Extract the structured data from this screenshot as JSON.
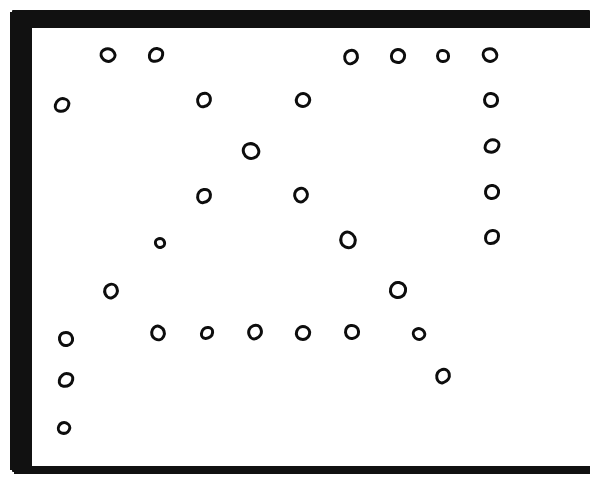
{
  "figure": {
    "background_color": "#ffffff",
    "ink_color": "#0d0d0d",
    "frame": {
      "label": "thick hand-inked rectangular border",
      "outer": {
        "x": 12,
        "y": 10,
        "width": 578,
        "height": 462
      },
      "inner": {
        "x": 20,
        "y": 18,
        "width": 558,
        "height": 438
      },
      "thickness_px": 8,
      "color": "#111111"
    },
    "ghost_text": "",
    "marker_count": 32
  },
  "chart_data": {
    "type": "scatter",
    "xlabel": "",
    "ylabel": "",
    "xlim": [
      0,
      597
    ],
    "ylim": [
      480,
      0
    ],
    "grid": false,
    "legend": "none",
    "marker_style": "open-circle",
    "marker_color": "#0d0d0d",
    "points": [
      {
        "id": "c01",
        "x": 108,
        "y": 55,
        "r": 8,
        "sw": 3
      },
      {
        "id": "c02",
        "x": 156,
        "y": 55,
        "r": 8,
        "sw": 3
      },
      {
        "id": "c03",
        "x": 351,
        "y": 57,
        "r": 8,
        "sw": 3
      },
      {
        "id": "c04",
        "x": 398,
        "y": 56,
        "r": 8,
        "sw": 3
      },
      {
        "id": "c05",
        "x": 443,
        "y": 56,
        "r": 7,
        "sw": 3
      },
      {
        "id": "c06",
        "x": 490,
        "y": 55,
        "r": 8,
        "sw": 3
      },
      {
        "id": "c07",
        "x": 62,
        "y": 105,
        "r": 8,
        "sw": 3
      },
      {
        "id": "c08",
        "x": 204,
        "y": 100,
        "r": 8,
        "sw": 3
      },
      {
        "id": "c09",
        "x": 303,
        "y": 100,
        "r": 8,
        "sw": 3
      },
      {
        "id": "c10",
        "x": 491,
        "y": 100,
        "r": 8,
        "sw": 3
      },
      {
        "id": "c11",
        "x": 251,
        "y": 151,
        "r": 9,
        "sw": 3
      },
      {
        "id": "c12",
        "x": 492,
        "y": 146,
        "r": 8,
        "sw": 3
      },
      {
        "id": "c13",
        "x": 204,
        "y": 196,
        "r": 8,
        "sw": 3
      },
      {
        "id": "c14",
        "x": 301,
        "y": 195,
        "r": 8,
        "sw": 3
      },
      {
        "id": "c15",
        "x": 492,
        "y": 192,
        "r": 8,
        "sw": 3
      },
      {
        "id": "c16",
        "x": 160,
        "y": 243,
        "r": 6,
        "sw": 3
      },
      {
        "id": "c17",
        "x": 348,
        "y": 240,
        "r": 9,
        "sw": 3
      },
      {
        "id": "c18",
        "x": 492,
        "y": 237,
        "r": 8,
        "sw": 3
      },
      {
        "id": "c19",
        "x": 111,
        "y": 291,
        "r": 8,
        "sw": 3
      },
      {
        "id": "c20",
        "x": 398,
        "y": 290,
        "r": 9,
        "sw": 3
      },
      {
        "id": "c21",
        "x": 66,
        "y": 339,
        "r": 8,
        "sw": 3
      },
      {
        "id": "c22",
        "x": 158,
        "y": 333,
        "r": 8,
        "sw": 3
      },
      {
        "id": "c23",
        "x": 207,
        "y": 333,
        "r": 7,
        "sw": 3
      },
      {
        "id": "c24",
        "x": 255,
        "y": 332,
        "r": 8,
        "sw": 3
      },
      {
        "id": "c25",
        "x": 303,
        "y": 333,
        "r": 8,
        "sw": 3
      },
      {
        "id": "c26",
        "x": 352,
        "y": 332,
        "r": 8,
        "sw": 3
      },
      {
        "id": "c27",
        "x": 419,
        "y": 334,
        "r": 7,
        "sw": 3
      },
      {
        "id": "c28",
        "x": 66,
        "y": 380,
        "r": 8,
        "sw": 3
      },
      {
        "id": "c29",
        "x": 443,
        "y": 376,
        "r": 8,
        "sw": 3
      },
      {
        "id": "c30",
        "x": 64,
        "y": 428,
        "r": 7,
        "sw": 3
      }
    ]
  }
}
